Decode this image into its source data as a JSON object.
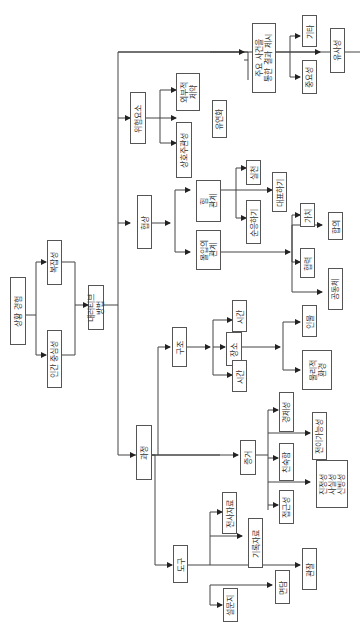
{
  "diagram": {
    "orientation": "rotated-90-ccw",
    "nodes": {
      "root": "상황 경험",
      "complexity": "복잡성",
      "human_centered": "인간 중심성",
      "narrative": "내러티브\n방법",
      "risk": "위험요소",
      "external_constraint": "외부적\n제약",
      "interdependence": "상호주관성",
      "flexibility": "유연화",
      "key_events": "주요 사건을\n통한 결과 제시",
      "etc": "기타",
      "importance": "중요성",
      "similarity": "유사성",
      "cooperation": "협상",
      "power_relation": "힘\n관계",
      "practice": "실천",
      "represent": "대표하기",
      "comply": "순응하기",
      "immersion_relation": "몰입의\n관계",
      "value": "가치",
      "consensus": "합의",
      "collaboration": "협력",
      "community": "공동체",
      "process": "과정",
      "structure": "구조",
      "time_1": "시간",
      "place": "장소",
      "time_2": "시간",
      "person": "인물",
      "physical_env": "물리적\n환경",
      "evidence": "증거",
      "persuasiveness": "경제성",
      "transferability": "전이가능성",
      "familiarity": "친숙함",
      "authenticity": "진정성\n사실성\n신빙성",
      "accessibility": "접근성",
      "tools": "도구",
      "transcript": "전사자료",
      "records": "기록자료",
      "observation": "관찰",
      "interview": "면담",
      "questionnaire": "설문지"
    }
  }
}
